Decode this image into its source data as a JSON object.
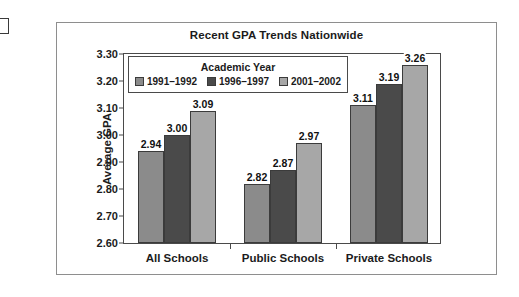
{
  "figure": {
    "title": "Recent GPA Trends Nationwide"
  },
  "legend": {
    "title": "Academic Year"
  },
  "chart_data": {
    "type": "bar",
    "title": "Recent GPA Trends Nationwide",
    "xlabel": "",
    "ylabel": "Average GPA",
    "ylim": [
      2.6,
      3.3
    ],
    "ytick_step": 0.1,
    "yticks": [
      "3.30",
      "3.20",
      "3.10",
      "3.00",
      "2.90",
      "2.80",
      "2.70",
      "2.60"
    ],
    "grid": false,
    "legend_position": "top-left-inside",
    "legend_title": "Academic Year",
    "categories": [
      "All Schools",
      "Public Schools",
      "Private Schools"
    ],
    "series": [
      {
        "name": "1991–1992",
        "color": "#8b8b8b",
        "values": [
          2.94,
          2.82,
          3.11
        ],
        "labels": [
          "2.94",
          "2.82",
          "3.11"
        ]
      },
      {
        "name": "1996–1997",
        "color": "#4a4a4a",
        "values": [
          3.0,
          2.87,
          3.19
        ],
        "labels": [
          "3.00",
          "2.87",
          "3.19"
        ]
      },
      {
        "name": "2001–2002",
        "color": "#a7a7a7",
        "values": [
          3.09,
          2.97,
          3.26
        ],
        "labels": [
          "3.09",
          "2.97",
          "3.26"
        ]
      }
    ]
  }
}
